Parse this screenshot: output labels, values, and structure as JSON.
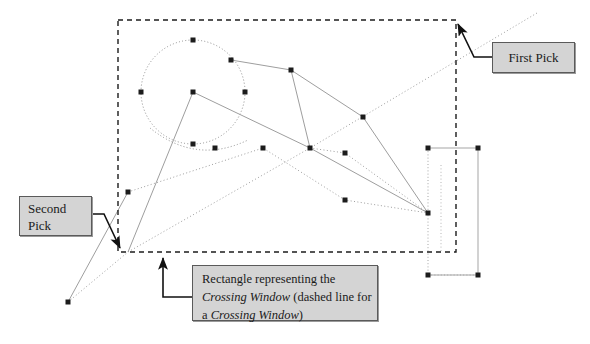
{
  "diagram": {
    "background_color": "#ffffff",
    "geometry_color": "#9a9a9a",
    "grip_color": "#1c1c1c",
    "dashed_window_color": "#1c1c1c",
    "callout_fill": "#d4d4d4",
    "callout_border": "#5a5a5a",
    "crossing_window": {
      "x": 118,
      "y": 20,
      "width": 338,
      "height": 232,
      "line_style": "dashed"
    },
    "circle": {
      "cx": 193,
      "cy": 92,
      "r": 52,
      "line_style": "dotted"
    },
    "right_rectangle": {
      "x": 427,
      "y": 148,
      "width": 51,
      "height": 127,
      "line_style": "solid-thin"
    },
    "grips": [
      {
        "x": 193,
        "cy_label": "circle-top",
        "y": 40
      },
      {
        "x": 141,
        "cy_label": "circle-left",
        "y": 92
      },
      {
        "x": 245,
        "cy_label": "circle-right",
        "y": 92
      },
      {
        "x": 193,
        "cy_label": "circle-bottom",
        "y": 144
      },
      {
        "x": 193,
        "cy_label": "circle-center",
        "y": 92
      },
      {
        "x": 215,
        "cy_label": "arc-left",
        "y": 108
      },
      {
        "x": 291,
        "cy_label": "poly-top",
        "y": 70
      },
      {
        "x": 363,
        "cy_label": "poly-mid-right",
        "y": 117
      },
      {
        "x": 263,
        "cy_label": "poly-node",
        "y": 148
      },
      {
        "x": 305,
        "cy_label": "poly-node-b",
        "y": 147
      },
      {
        "x": 310,
        "cy_label": "poly-node-c",
        "y": 148
      },
      {
        "x": 128,
        "cy_label": "poly-lower-left",
        "y": 192
      },
      {
        "x": 345,
        "cy_label": "poly-lower",
        "y": 200
      },
      {
        "x": 428,
        "cy_label": "rect-grip-tl",
        "y": 148
      },
      {
        "x": 478,
        "cy_label": "rect-grip-tr",
        "y": 148
      },
      {
        "x": 428,
        "cy_label": "rect-grip-ml",
        "y": 213
      },
      {
        "x": 428,
        "cy_label": "rect-grip-bl",
        "y": 275
      },
      {
        "x": 478,
        "cy_label": "rect-grip-br",
        "y": 275
      },
      {
        "x": 68,
        "cy_label": "outside-point",
        "y": 302
      }
    ]
  },
  "callouts": {
    "first_pick": {
      "label": "First Pick",
      "target": "top-right corner of crossing window"
    },
    "second_pick": {
      "line1": "Second",
      "line2": "Pick",
      "target": "bottom-left corner of crossing window"
    },
    "crossing_window_note": {
      "line1_a": "Rectangle representing the",
      "line2_a": "Crossing Window",
      "line2_b": " (dashed line for",
      "line3_a": "a ",
      "line3_b": "Crossing Window",
      "line3_c": ")"
    }
  }
}
